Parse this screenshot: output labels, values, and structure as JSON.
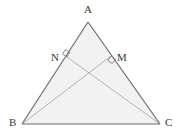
{
  "figure": {
    "kind": "geometry-diagram",
    "background_color": "#ffffff",
    "fill_color": "#f2f2f2",
    "edge_color": "#6e6e6e",
    "cevian_color": "#b4b4b4",
    "label_color": "#3a3a3a",
    "triangle": {
      "name": "ABC",
      "vertices": [
        {
          "id": "A",
          "label": "A",
          "x": 88,
          "y": 22
        },
        {
          "id": "B",
          "label": "B",
          "x": 22,
          "y": 124
        },
        {
          "id": "C",
          "label": "C",
          "x": 160,
          "y": 124
        }
      ],
      "edges": [
        {
          "id": "AB",
          "from": "A",
          "to": "B"
        },
        {
          "id": "AC",
          "from": "A",
          "to": "C"
        },
        {
          "id": "BC",
          "from": "B",
          "to": "C"
        }
      ]
    },
    "points": [
      {
        "id": "N",
        "label": "N",
        "x": 67,
        "y": 57,
        "on_edge": "AB"
      },
      {
        "id": "M",
        "label": "M",
        "x": 111,
        "y": 56,
        "on_edge": "AC"
      }
    ],
    "cevians": [
      {
        "id": "BM",
        "from": "B",
        "to": "M",
        "perpendicular_to": "AC"
      },
      {
        "id": "CN",
        "from": "C",
        "to": "N",
        "perpendicular_to": "AB"
      }
    ],
    "right_angle_marks": [
      {
        "id": "right-angle-at-N",
        "at": "N",
        "x": 67,
        "y": 57
      },
      {
        "id": "right-angle-at-M",
        "at": "M",
        "x": 111,
        "y": 56
      }
    ],
    "labels": {
      "A": {
        "text": "A",
        "left": 84,
        "top": 4
      },
      "B": {
        "text": "B",
        "left": 9,
        "top": 117
      },
      "C": {
        "text": "C",
        "left": 165,
        "top": 117
      },
      "N": {
        "text": "N",
        "left": 51,
        "top": 52
      },
      "M": {
        "text": "M",
        "left": 117,
        "top": 52
      }
    }
  }
}
